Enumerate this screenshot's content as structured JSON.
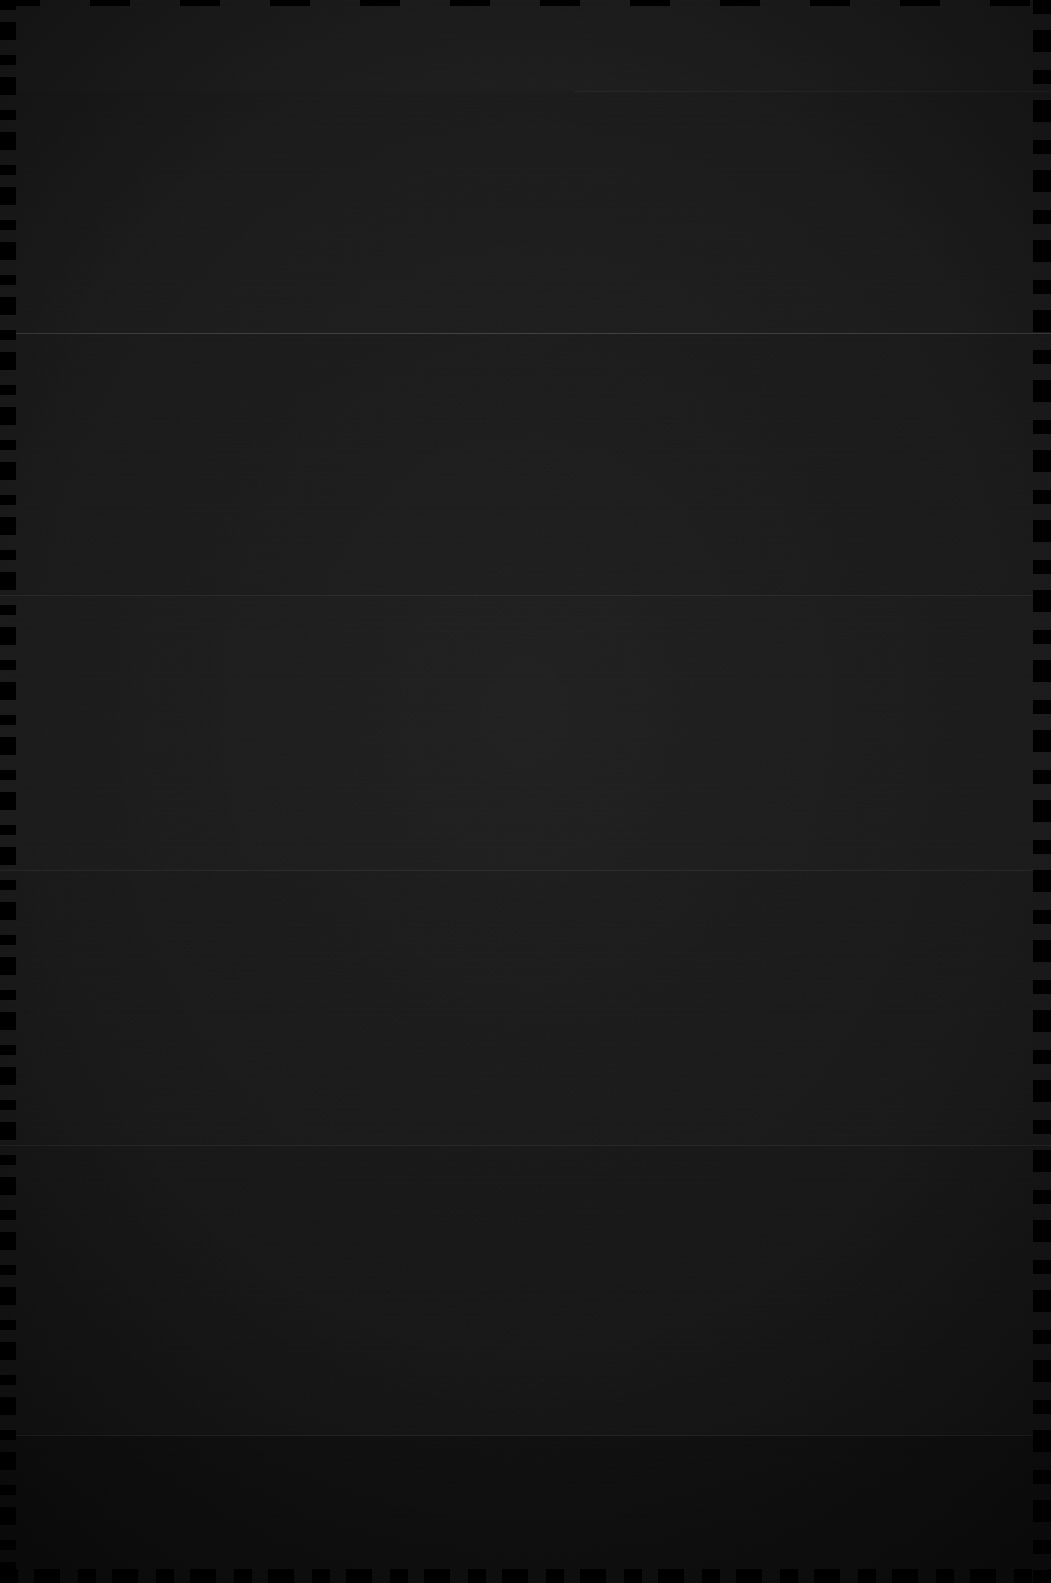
{
  "capture": {
    "width": 1051,
    "height": 1583,
    "description": "Near-black dark-theme screen capture with no legible text or icons",
    "legible_text": "",
    "content_state": "blank"
  },
  "colors": {
    "background": "#0b0b0b",
    "surface": "#1e1e1e",
    "band_light": "#232323",
    "band_mid": "#1e1e1e",
    "band_dark": "#1a1a1a",
    "band_darkest": "#151515",
    "divider_strong": "#4a4a4a",
    "divider": "#3a3a3a",
    "divider_faint": "#2e2e2e",
    "edge": "#000000"
  },
  "bands": [
    {
      "name": "band-top",
      "top": 0,
      "height": 91,
      "shade": "#232323"
    },
    {
      "name": "band-upper",
      "top": 91,
      "height": 242,
      "shade": "#212121"
    },
    {
      "name": "band-upper-middle",
      "top": 333,
      "height": 262,
      "shade": "#1f1f1f"
    },
    {
      "name": "band-middle",
      "top": 595,
      "height": 275,
      "shade": "#202020"
    },
    {
      "name": "band-lower-middle",
      "top": 870,
      "height": 275,
      "shade": "#1e1e1e"
    },
    {
      "name": "band-lower",
      "top": 1145,
      "height": 290,
      "shade": "#1c1c1c"
    },
    {
      "name": "band-bottom",
      "top": 1435,
      "height": 148,
      "shade": "#151515"
    }
  ],
  "dividers": [
    {
      "name": "divider-partial-top",
      "top": 91,
      "left": 575,
      "width": 476,
      "weight": "faint"
    },
    {
      "name": "divider-primary",
      "top": 333,
      "left": 0,
      "width": 1051,
      "weight": "strong"
    },
    {
      "name": "divider-secondary",
      "top": 595,
      "left": 0,
      "width": 1051,
      "weight": "faint"
    },
    {
      "name": "divider-tertiary",
      "top": 870,
      "left": 0,
      "width": 1051,
      "weight": "faint"
    },
    {
      "name": "divider-quaternary",
      "top": 1145,
      "left": 0,
      "width": 1051,
      "weight": "faint"
    },
    {
      "name": "divider-quinary",
      "top": 1435,
      "left": 0,
      "width": 1051,
      "weight": "faint"
    }
  ]
}
